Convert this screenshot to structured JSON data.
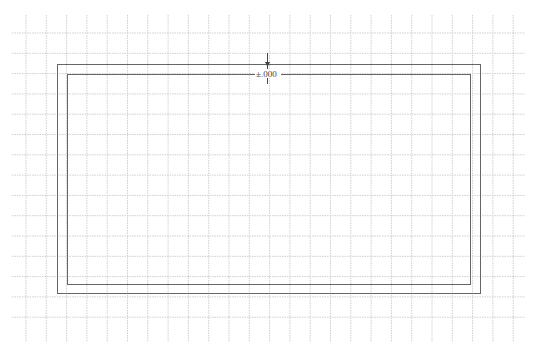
{
  "canvas": {
    "width": 535,
    "height": 350,
    "background": "#ffffff"
  },
  "grid": {
    "color": "#cfcfcf",
    "style": "dotted",
    "vertical_x_start": 26,
    "vertical_count": 25,
    "vertical_y_range": [
      15,
      342
    ],
    "horizontal_y_start": 33,
    "horizontal_count": 15,
    "horizontal_x_range": [
      12,
      525
    ],
    "spacing": 20.3
  },
  "shapes": {
    "outer_rect": {
      "x": 57,
      "y": 64,
      "width": 423,
      "height": 229,
      "stroke": "#666666"
    },
    "inner_rect": {
      "x": 67,
      "y": 74,
      "width": 403,
      "height": 210,
      "stroke": "#666666"
    }
  },
  "level_marker": {
    "x": 267,
    "y_top": 53,
    "y_bottom": 84,
    "label": "±.000",
    "color": "#444444"
  }
}
